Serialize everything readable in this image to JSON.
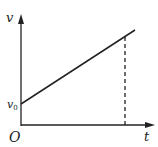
{
  "diagram": {
    "type": "velocity-time graph",
    "axes": {
      "y_label": "v",
      "x_label": "t",
      "origin_label": "O"
    },
    "intercept_label": "v",
    "intercept_subscript": "0",
    "line": {
      "description": "straight line increasing from v0 intercept",
      "style": "solid"
    },
    "marker": {
      "description": "vertical dashed line from graph line to t-axis",
      "style": "dashed"
    },
    "colors": {
      "ink": "#222222",
      "background": "#ffffff"
    }
  }
}
